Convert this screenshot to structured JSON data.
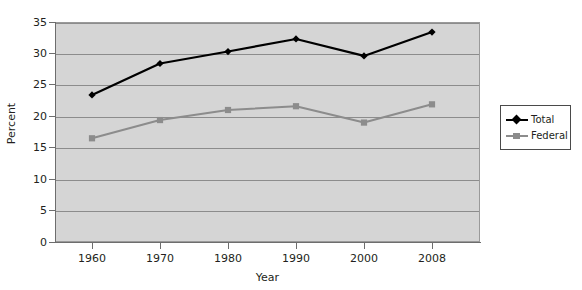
{
  "chart_data": {
    "type": "line",
    "title": "",
    "xlabel": "Year",
    "ylabel": "Percent",
    "categories": [
      "1960",
      "1970",
      "1980",
      "1990",
      "2000",
      "2008"
    ],
    "x": [
      1960,
      1970,
      1980,
      1990,
      2000,
      2008
    ],
    "series": [
      {
        "name": "Total",
        "color": "#000000",
        "marker": "diamond",
        "values": [
          23.4,
          28.4,
          30.3,
          32.3,
          29.6,
          33.4
        ]
      },
      {
        "name": "Federal",
        "color": "#8c8c8c",
        "marker": "square",
        "values": [
          16.5,
          19.4,
          21.0,
          21.6,
          19.0,
          21.9
        ]
      }
    ],
    "ylim": [
      0,
      35
    ],
    "yticks": [
      0,
      5,
      10,
      15,
      20,
      25,
      30,
      35
    ],
    "ytick_labels": [
      "0",
      "5",
      "10",
      "15",
      "20",
      "25",
      "30",
      "35"
    ],
    "xtick_labels": [
      "1960",
      "1970",
      "1980",
      "1990",
      "2000",
      "2008"
    ],
    "grid": true,
    "grid_axis": "y",
    "legend_position": "right",
    "plot_background": "#d5d5d5",
    "page_background": "#ffffff"
  },
  "legend": {
    "entries": [
      {
        "label": "Total"
      },
      {
        "label": "Federal"
      }
    ]
  },
  "axes": {
    "x_title": "Year",
    "y_title": "Percent"
  }
}
